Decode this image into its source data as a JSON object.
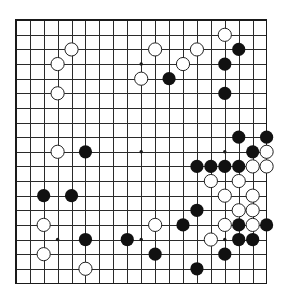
{
  "board": {
    "size": 19,
    "colors": {
      "background": "#ffffff",
      "line": "#2a2a2a",
      "black_stone": "#111111",
      "white_stone": "#ffffff",
      "white_outline": "#222222"
    },
    "star_points": [
      [
        3,
        3
      ],
      [
        9,
        3
      ],
      [
        15,
        3
      ],
      [
        3,
        9
      ],
      [
        9,
        9
      ],
      [
        15,
        9
      ],
      [
        3,
        15
      ],
      [
        9,
        15
      ],
      [
        15,
        15
      ]
    ],
    "stones": {
      "white": [
        [
          15,
          1
        ],
        [
          4,
          2
        ],
        [
          10,
          2
        ],
        [
          13,
          2
        ],
        [
          3,
          3
        ],
        [
          12,
          3
        ],
        [
          9,
          4
        ],
        [
          3,
          5
        ],
        [
          3,
          9
        ],
        [
          18,
          9
        ],
        [
          17,
          10
        ],
        [
          18,
          10
        ],
        [
          14,
          11
        ],
        [
          16,
          11
        ],
        [
          15,
          12
        ],
        [
          17,
          12
        ],
        [
          16,
          13
        ],
        [
          17,
          13
        ],
        [
          2,
          14
        ],
        [
          10,
          14
        ],
        [
          15,
          14
        ],
        [
          17,
          14
        ],
        [
          14,
          15
        ],
        [
          2,
          16
        ],
        [
          5,
          17
        ]
      ],
      "black": [
        [
          16,
          2
        ],
        [
          15,
          3
        ],
        [
          11,
          4
        ],
        [
          15,
          5
        ],
        [
          16,
          8
        ],
        [
          18,
          8
        ],
        [
          17,
          9
        ],
        [
          5,
          9
        ],
        [
          13,
          10
        ],
        [
          14,
          10
        ],
        [
          15,
          10
        ],
        [
          16,
          10
        ],
        [
          2,
          12
        ],
        [
          4,
          12
        ],
        [
          13,
          13
        ],
        [
          12,
          14
        ],
        [
          16,
          14
        ],
        [
          18,
          14
        ],
        [
          5,
          15
        ],
        [
          8,
          15
        ],
        [
          16,
          15
        ],
        [
          17,
          15
        ],
        [
          10,
          16
        ],
        [
          15,
          16
        ],
        [
          13,
          17
        ]
      ]
    }
  }
}
